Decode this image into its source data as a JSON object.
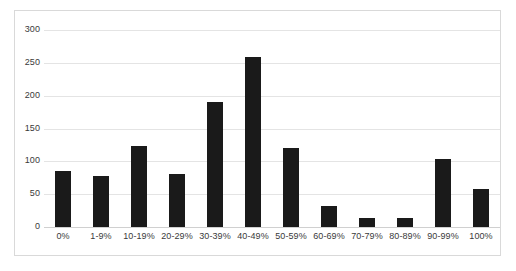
{
  "chart_data": {
    "type": "bar",
    "title": "",
    "subtitle": "",
    "xlabel": "",
    "ylabel": "",
    "categories": [
      "0%",
      "1-9%",
      "10-19%",
      "20-29%",
      "30-39%",
      "40-49%",
      "50-59%",
      "60-69%",
      "70-79%",
      "80-89%",
      "90-99%",
      "100%"
    ],
    "values": [
      85,
      77,
      123,
      81,
      190,
      259,
      120,
      32,
      13,
      14,
      103,
      58
    ],
    "series": [
      {
        "name": "",
        "values": [
          85,
          77,
          123,
          81,
          190,
          259,
          120,
          32,
          13,
          14,
          103,
          58
        ]
      }
    ],
    "ylim": [
      0,
      300
    ],
    "y_ticks": [
      0,
      50,
      100,
      150,
      200,
      250,
      300
    ],
    "y_tick_labels": [
      "0",
      "50",
      "100",
      "150",
      "200",
      "250",
      "300"
    ],
    "grid": true,
    "grid_axis": "y",
    "legend": false,
    "legend_position": "none",
    "bar_color": "#1a1a1a",
    "gridline_color": "#e4e4e4",
    "axis_color": "#d0d0d0",
    "frame_color": "#d9d9d9",
    "background_color": "#ffffff",
    "text_color": "#3a3a3a"
  }
}
